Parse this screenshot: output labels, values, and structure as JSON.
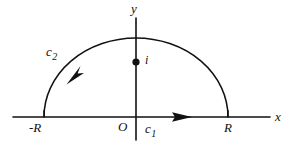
{
  "figure": {
    "kind": "complex-plane-contour-diagram",
    "background_color": "#ffffff",
    "stroke_color": "#111111",
    "width": 291,
    "height": 151
  },
  "axes": {
    "x_label": "x",
    "y_label": "y",
    "origin_label": "O",
    "x_line": {
      "x1": 13,
      "y1": 117,
      "x2": 270,
      "y2": 117
    },
    "y_line": {
      "x1": 136,
      "y1": 18,
      "x2": 136,
      "y2": 140
    }
  },
  "contour": {
    "center_x": 136,
    "center_y": 117,
    "radius_x": 92,
    "radius_y": 79,
    "left_endpoint_label": "-R",
    "right_endpoint_label": "R",
    "segments": [
      {
        "name": "c1",
        "label": "c",
        "subscript": "1",
        "description": "real-axis segment from -R to R",
        "direction": "rightward"
      },
      {
        "name": "c2",
        "label": "c",
        "subscript": "2",
        "description": "upper semicircular arc of radius R",
        "direction": "counterclockwise"
      }
    ]
  },
  "pole": {
    "label": "i",
    "x": 136,
    "y": 62,
    "dot_radius": 3.6
  }
}
